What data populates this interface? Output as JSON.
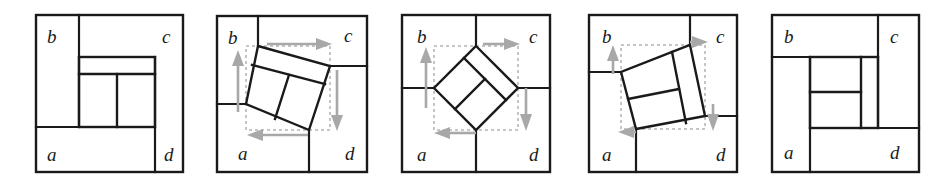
{
  "figure": {
    "panel_count": 5,
    "type": "geometric-dissection-diagram",
    "colors": {
      "line": "#1a1a1a",
      "guide_dash": "#b3b3b3",
      "arrow": "#a8a8a8",
      "background": "#ffffff"
    },
    "region_labels": [
      "b",
      "c",
      "a",
      "d"
    ],
    "label_positions": {
      "b": "top-left",
      "c": "top-right",
      "a": "bottom-left",
      "d": "bottom-right"
    }
  },
  "panels": [
    {
      "index": 1,
      "name": "panel-1",
      "rotation_degrees": 0,
      "has_guides": false,
      "has_arrows": false,
      "labels": {
        "b": "b",
        "c": "c",
        "a": "a",
        "d": "d"
      }
    },
    {
      "index": 2,
      "name": "panel-2",
      "rotation_degrees": 20,
      "has_guides": true,
      "has_arrows": true,
      "labels": {
        "b": "b",
        "c": "c",
        "a": "a",
        "d": "d"
      }
    },
    {
      "index": 3,
      "name": "panel-3",
      "rotation_degrees": 45,
      "has_guides": true,
      "has_arrows": true,
      "labels": {
        "b": "b",
        "c": "c",
        "a": "a",
        "d": "d"
      }
    },
    {
      "index": 4,
      "name": "panel-4",
      "rotation_degrees": 70,
      "has_guides": true,
      "has_arrows": true,
      "labels": {
        "b": "b",
        "c": "c",
        "a": "a",
        "d": "d"
      }
    },
    {
      "index": 5,
      "name": "panel-5",
      "rotation_degrees": 90,
      "has_guides": false,
      "has_arrows": false,
      "labels": {
        "b": "b",
        "c": "c",
        "a": "a",
        "d": "d"
      }
    }
  ],
  "arrows": {
    "up": "arrow-up",
    "right": "arrow-right",
    "down": "arrow-down",
    "left": "arrow-left"
  }
}
